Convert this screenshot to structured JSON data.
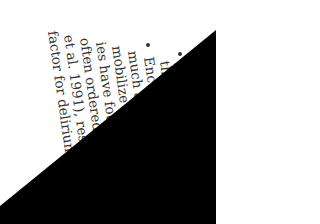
{
  "document": {
    "orientation": "rotated ~90° clockwise",
    "bullets": 2,
    "lines": [
      {
        "text": "the"
      },
      {
        "text": "Encou"
      },
      {
        "text": "much as p"
      },
      {
        "text": "mobilize the p"
      },
      {
        "text": "ies have found th"
      },
      {
        "text": "often ordered without"
      },
      {
        "text": "et al. 1991), resulting in"
      },
      {
        "text": "factor for delirium."
      }
    ]
  },
  "colors": {
    "page": "#ffffff",
    "text": "#333333",
    "occlusion": "#000000"
  }
}
